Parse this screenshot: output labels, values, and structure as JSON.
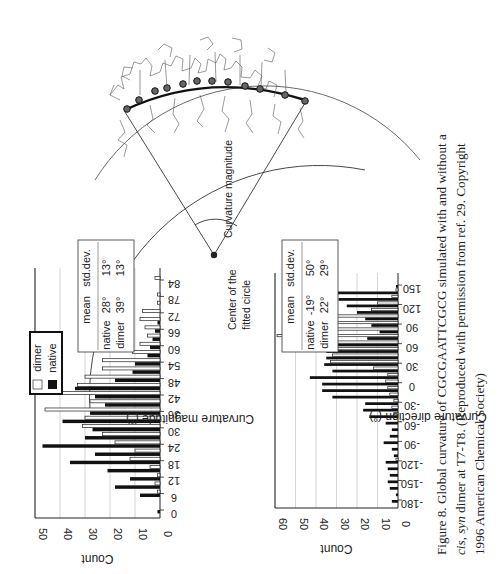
{
  "page": {
    "orientation": "rotated 90 degrees (landscape figure on portrait page)"
  },
  "diagram": {
    "label_curvature_magnitude": "Curvature magnitude",
    "label_center_line1": "Center of the",
    "label_center_line2": "fitted circle"
  },
  "chart_data": [
    {
      "type": "bar",
      "title": "",
      "xlabel": "Curvature magnitude (°)",
      "ylabel": "Count",
      "ylim": [
        0,
        50
      ],
      "yticks": [
        0,
        10,
        20,
        30,
        40,
        50
      ],
      "xticks": [
        "0",
        "6",
        "12",
        "18",
        "24",
        "30",
        "36",
        "42",
        "48",
        "54",
        "60",
        "66",
        "72",
        "78",
        "84"
      ],
      "legend": [
        "dimer",
        "native"
      ],
      "grid": true,
      "categories": [
        "0",
        "3",
        "6",
        "9",
        "12",
        "15",
        "18",
        "21",
        "24",
        "27",
        "30",
        "33",
        "36",
        "39",
        "42",
        "45",
        "48",
        "51",
        "54",
        "57",
        "60",
        "63",
        "66",
        "69",
        "72",
        "75",
        "78",
        "81",
        "84"
      ],
      "series": [
        {
          "name": "native",
          "color": "#111111",
          "values": [
            1,
            0,
            8,
            18,
            12,
            21,
            36,
            26,
            47,
            30,
            27,
            39,
            28,
            22,
            26,
            34,
            18,
            11,
            10,
            5,
            4,
            3,
            2,
            1,
            0,
            0,
            0,
            0,
            0
          ]
        },
        {
          "name": "dimer",
          "color": "#ffffff",
          "values": [
            0,
            0,
            1,
            2,
            1,
            4,
            12,
            10,
            18,
            23,
            31,
            30,
            46,
            28,
            41,
            33,
            30,
            23,
            23,
            11,
            8,
            5,
            6,
            8,
            7,
            1,
            1,
            0,
            2
          ]
        }
      ],
      "stats_table": {
        "headers": [
          "",
          "mean",
          "std.dev."
        ],
        "rows": [
          [
            "native",
            "28°",
            "13°"
          ],
          [
            "dimer",
            "39°",
            "13°"
          ]
        ]
      }
    },
    {
      "type": "bar",
      "title": "",
      "xlabel": "Curvature direction (°)",
      "ylabel": "Count",
      "ylim": [
        0,
        60
      ],
      "yticks": [
        0,
        10,
        20,
        30,
        40,
        50,
        60
      ],
      "xticks": [
        "-180",
        "-150",
        "-120",
        "-90",
        "-60",
        "-30",
        "0",
        "30",
        "60",
        "90",
        "120",
        "150"
      ],
      "grid": true,
      "categories": [
        "-180",
        "-170",
        "-160",
        "-150",
        "-140",
        "-130",
        "-120",
        "-110",
        "-100",
        "-90",
        "-80",
        "-70",
        "-60",
        "-50",
        "-40",
        "-30",
        "-20",
        "-10",
        "0",
        "10",
        "20",
        "30",
        "40",
        "50",
        "60",
        "70",
        "80",
        "90",
        "100",
        "110",
        "120",
        "130",
        "140",
        "150"
      ],
      "series": [
        {
          "name": "native",
          "color": "#111111",
          "values": [
            3,
            1,
            4,
            5,
            4,
            5,
            6,
            2,
            3,
            7,
            4,
            3,
            6,
            14,
            17,
            16,
            32,
            37,
            37,
            43,
            32,
            36,
            35,
            35,
            38,
            15,
            9,
            13,
            16,
            20,
            25,
            29,
            32,
            1
          ]
        },
        {
          "name": "dimer",
          "color": "#ffffff",
          "values": [
            0,
            0,
            0,
            0,
            0,
            0,
            1,
            0,
            0,
            0,
            0,
            0,
            0,
            2,
            3,
            2,
            4,
            5,
            6,
            5,
            12,
            33,
            32,
            44,
            54,
            59,
            56,
            52,
            42,
            13,
            10,
            3,
            1,
            0
          ]
        }
      ],
      "stats_table": {
        "headers": [
          "",
          "mean",
          "std.dev."
        ],
        "rows": [
          [
            "native",
            "-19°",
            "50°"
          ],
          [
            "dimer",
            "22°",
            "29°"
          ]
        ]
      }
    }
  ],
  "caption": {
    "line1": "Figure 8. Global curvature of CGCGAATTCGCG simulated with and without a",
    "line2_italic": "cis, syn",
    "line2_rest": " dimer at T7-T8. (Reproduced with permission from ref. 29. Copyright",
    "line3": "1996 American Chemical Society)"
  }
}
